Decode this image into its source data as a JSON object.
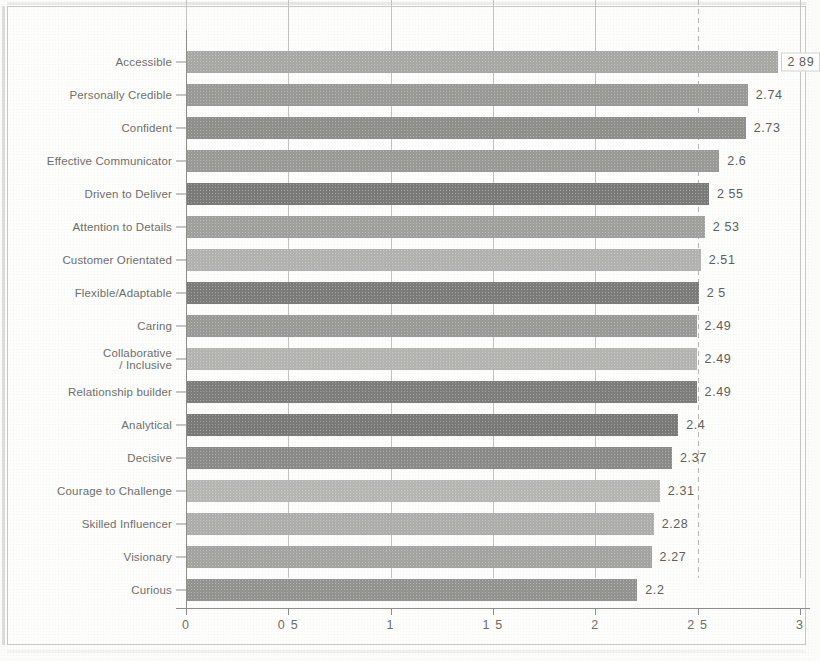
{
  "chart_data": {
    "type": "bar",
    "orientation": "horizontal",
    "title": "",
    "subtitle": "",
    "xlabel": "",
    "ylabel": "",
    "xlim": [
      0,
      3
    ],
    "grid": true,
    "legend": false,
    "legend_position": "none",
    "xtick_labels": [
      "0",
      "0 5",
      "1",
      "1 5",
      "2",
      "2 5",
      "3"
    ],
    "xtick_values": [
      0,
      0.5,
      1,
      1.5,
      2,
      2.5,
      3
    ],
    "categories": [
      "Accessible",
      "Personally Credible",
      "Confident",
      "Effective Communicator",
      "Driven to Deliver",
      "Attention to Details",
      "Customer Orientated",
      "Flexible/Adaptable",
      "Caring",
      "Collaborative\n/ Inclusive",
      "Relationship builder",
      "Analytical",
      "Decisive",
      "Courage to Challenge",
      "Skilled Influencer",
      "Visionary",
      "Curious"
    ],
    "values": [
      2.89,
      2.74,
      2.73,
      2.6,
      2.55,
      2.53,
      2.51,
      2.5,
      2.49,
      2.49,
      2.49,
      2.4,
      2.37,
      2.31,
      2.28,
      2.27,
      2.2
    ],
    "value_labels": [
      "2 89",
      "2.74",
      "2.73",
      "2.6",
      "2 55",
      "2 53",
      "2.51",
      "2 5",
      "2.49",
      "2.49",
      "2.49",
      "2.4",
      "2.37",
      "2.31",
      "2.28",
      "2.27",
      "2.2"
    ],
    "bar_colors": [
      "#a8a8a5",
      "#9a9a97",
      "#8f8f8c",
      "#9a9a97",
      "#7b7b79",
      "#a0a09d",
      "#b2b2af",
      "#7c7c7a",
      "#9a9a97",
      "#b4b4b1",
      "#7e7e7c",
      "#7a7a78",
      "#8b8b89",
      "#b6b6b3",
      "#aeaeab",
      "#a4a4a1",
      "#939390"
    ],
    "highlighted_index": 0
  }
}
